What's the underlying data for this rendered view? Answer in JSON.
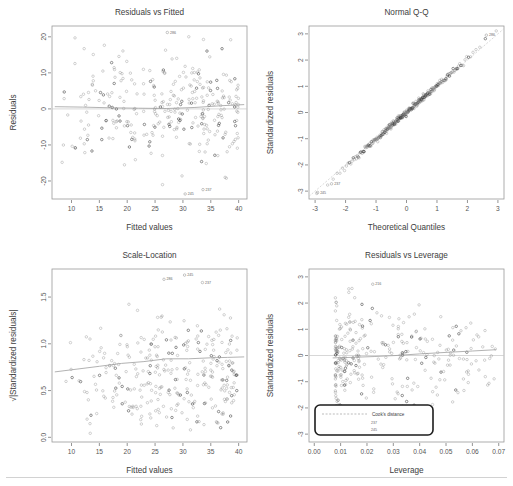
{
  "figure": {
    "background": "#ffffff",
    "point_color": "#6e6e6e",
    "point_color_dark": "#1f1f1f",
    "trend_color": "#9e9e9e",
    "reference_color": "#c6c6c6",
    "frame_color": "#9a9a9a",
    "separator_color": "#d2d2d2",
    "layout": "2x2 grid of regression diagnostic plots"
  },
  "chart_data": [
    {
      "type": "scatter",
      "panel": "top-left",
      "title": "Residuals vs Fitted",
      "xlabel": "Fitted values",
      "ylabel": "Residuals",
      "xlim": [
        6.5,
        41.5
      ],
      "ylim": [
        -25,
        23
      ],
      "xticks": [
        10,
        15,
        20,
        25,
        30,
        35,
        40
      ],
      "yticks": [
        -20,
        -10,
        0,
        10,
        20
      ],
      "grid": false,
      "reference_line": {
        "type": "horizontal",
        "y": 0
      },
      "trend": "lowess",
      "trend_points": [
        [
          7,
          0.6
        ],
        [
          12,
          0.5
        ],
        [
          17,
          0.3
        ],
        [
          22,
          0.2
        ],
        [
          27,
          0.1
        ],
        [
          32,
          0.4
        ],
        [
          37,
          0.9
        ],
        [
          41,
          1.2
        ]
      ],
      "annotations": [
        {
          "label": "286",
          "x": 27.2,
          "y": 21.2
        },
        {
          "label": "237",
          "x": 33.6,
          "y": -22.4
        },
        {
          "label": "245",
          "x": 30.4,
          "y": -23.6
        }
      ],
      "n_points": 310,
      "seed": 17
    },
    {
      "type": "scatter",
      "panel": "top-right",
      "title": "Normal Q-Q",
      "xlabel": "Theoretical Quantiles",
      "ylabel": "Standardized residuals",
      "xlim": [
        -3.2,
        3.2
      ],
      "ylim": [
        -3.3,
        3.3
      ],
      "xticks": [
        -3,
        -2,
        -1,
        0,
        1,
        2,
        3
      ],
      "yticks": [
        -3,
        -2,
        -1,
        0,
        1,
        2,
        3
      ],
      "grid": false,
      "reference_line": {
        "type": "identity",
        "style": "dashed"
      },
      "annotations": [
        {
          "label": "245",
          "x": -2.92,
          "y": -3.05
        },
        {
          "label": "237",
          "x": -2.46,
          "y": -2.72
        },
        {
          "label": "286",
          "x": 2.62,
          "y": 2.95
        }
      ],
      "n_points": 310,
      "seed": 29
    },
    {
      "type": "scatter",
      "panel": "bottom-left",
      "title": "Scale-Location",
      "xlabel": "Fitted values",
      "ylabel": "√|Standardized residuals|",
      "xlim": [
        6.5,
        41.5
      ],
      "ylim": [
        -0.05,
        1.8
      ],
      "xticks": [
        10,
        15,
        20,
        25,
        30,
        35,
        40
      ],
      "yticks": [
        0.0,
        0.5,
        1.0,
        1.5
      ],
      "ytick_labels": [
        "0.0",
        "0.5",
        "1.0",
        "1.5"
      ],
      "grid": false,
      "trend": "lowess",
      "trend_points": [
        [
          7,
          0.7
        ],
        [
          11,
          0.73
        ],
        [
          15,
          0.76
        ],
        [
          19,
          0.79
        ],
        [
          23,
          0.81
        ],
        [
          27,
          0.84
        ],
        [
          31,
          0.84
        ],
        [
          35,
          0.85
        ],
        [
          38,
          0.855
        ],
        [
          41,
          0.86
        ]
      ],
      "annotations": [
        {
          "label": "286",
          "x": 26.6,
          "y": 1.69
        },
        {
          "label": "245",
          "x": 30.3,
          "y": 1.735
        },
        {
          "label": "237",
          "x": 33.5,
          "y": 1.655
        }
      ],
      "n_points": 310,
      "seed": 43
    },
    {
      "type": "scatter",
      "panel": "bottom-right",
      "title": "Residuals vs Leverage",
      "xlabel": "Leverage",
      "ylabel": "Standardized residuals",
      "xlim": [
        -0.002,
        0.072
      ],
      "ylim": [
        -3.3,
        3.3
      ],
      "xticks": [
        0.0,
        0.01,
        0.02,
        0.03,
        0.04,
        0.05,
        0.06,
        0.07
      ],
      "xtick_labels": [
        "0.00",
        "0.01",
        "0.02",
        "0.03",
        "0.04",
        "0.05",
        "0.06",
        "0.07"
      ],
      "yticks": [
        -3,
        -2,
        -1,
        0,
        1,
        2,
        3
      ],
      "grid": false,
      "reference_line": {
        "type": "horizontal",
        "y": 0
      },
      "trend": "lowess",
      "trend_points": [
        [
          0.007,
          -0.09
        ],
        [
          0.015,
          -0.07
        ],
        [
          0.023,
          -0.04
        ],
        [
          0.031,
          0.0
        ],
        [
          0.04,
          0.06
        ],
        [
          0.05,
          0.12
        ],
        [
          0.06,
          0.17
        ],
        [
          0.069,
          0.22
        ]
      ],
      "annotations": [
        {
          "label": "216",
          "x": 0.0222,
          "y": 2.72
        }
      ],
      "legend": {
        "position": "bottom-left",
        "title": "Cook's distance",
        "swatch": "dashed-line",
        "labels": [
          "237",
          "245"
        ]
      },
      "n_points": 310,
      "seed": 61
    }
  ]
}
